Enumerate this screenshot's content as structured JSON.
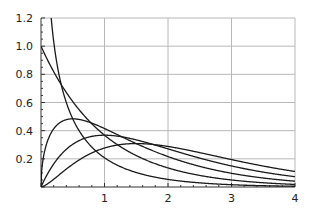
{
  "chart_data": {
    "type": "line",
    "title": "",
    "xlabel": "",
    "ylabel": "",
    "xlim": [
      0,
      4
    ],
    "ylim": [
      0,
      1.2
    ],
    "grid": true,
    "x_ticks": [
      "1",
      "2",
      "3",
      "4"
    ],
    "y_ticks": [
      "0.2",
      "0.4",
      "0.6",
      "0.8",
      "1.0",
      "1.2"
    ],
    "series": [
      {
        "name": "shape 0.5",
        "shape": 0.5,
        "points": [
          [
            0.1,
            2.28
          ],
          [
            0.25,
            1.27
          ],
          [
            0.5,
            0.48
          ],
          [
            1,
            0.21
          ],
          [
            2,
            0.05
          ],
          [
            3,
            0.016
          ],
          [
            4,
            0.005
          ]
        ]
      },
      {
        "name": "shape 1",
        "shape": 1,
        "points": [
          [
            0,
            1.0
          ],
          [
            0.5,
            0.61
          ],
          [
            1,
            0.37
          ],
          [
            2,
            0.14
          ],
          [
            3,
            0.05
          ],
          [
            4,
            0.02
          ]
        ]
      },
      {
        "name": "shape 1.5",
        "shape": 1.5,
        "points": [
          [
            0,
            0
          ],
          [
            0.5,
            0.48
          ],
          [
            1,
            0.42
          ],
          [
            2,
            0.21
          ],
          [
            3,
            0.1
          ],
          [
            4,
            0.04
          ]
        ]
      },
      {
        "name": "shape 2",
        "shape": 2,
        "points": [
          [
            0,
            0
          ],
          [
            0.5,
            0.3
          ],
          [
            1,
            0.37
          ],
          [
            2,
            0.27
          ],
          [
            3,
            0.15
          ],
          [
            4,
            0.07
          ]
        ]
      },
      {
        "name": "shape 2.5",
        "shape": 2.5,
        "points": [
          [
            0,
            0
          ],
          [
            0.5,
            0.16
          ],
          [
            1,
            0.28
          ],
          [
            1.5,
            0.31
          ],
          [
            2,
            0.29
          ],
          [
            3,
            0.2
          ],
          [
            4,
            0.11
          ]
        ]
      }
    ],
    "legend": "none"
  },
  "colors": {
    "line": "#1a1a1a",
    "grid": "#b8b8b8",
    "axis": "#333333"
  }
}
